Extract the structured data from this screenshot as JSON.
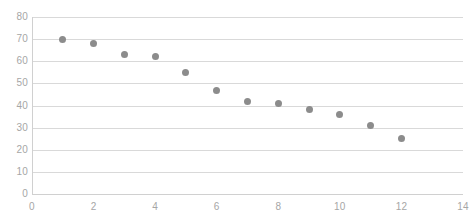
{
  "chart_data": {
    "type": "scatter",
    "title": "",
    "subtitle": "",
    "xlabel": "",
    "ylabel": "",
    "xlim": [
      0,
      14
    ],
    "ylim": [
      0,
      80
    ],
    "x_ticks": [
      0,
      2,
      4,
      6,
      8,
      10,
      12,
      14
    ],
    "y_ticks": [
      0,
      10,
      20,
      30,
      40,
      50,
      60,
      70,
      80
    ],
    "x_tick_labels": [
      "0",
      "2",
      "4",
      "6",
      "8",
      "10",
      "12",
      "14"
    ],
    "y_tick_labels": [
      "0",
      "10",
      "20",
      "30",
      "40",
      "50",
      "60",
      "70",
      "80"
    ],
    "grid": "horizontal",
    "legend": "none",
    "marker_color": "#8c8c8c",
    "gridline_color": "#d9d9d9",
    "axis_color": "#d0d0d0",
    "tick_label_color": "#a6a6a6",
    "series": [
      {
        "name": "Series 1",
        "x": [
          1,
          2,
          3,
          4,
          5,
          6,
          7,
          8,
          9,
          10,
          11,
          12
        ],
        "y": [
          70,
          68,
          63,
          62,
          55,
          47,
          42,
          41,
          38,
          36,
          31,
          25
        ]
      }
    ]
  }
}
